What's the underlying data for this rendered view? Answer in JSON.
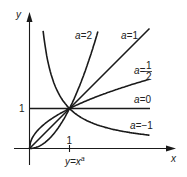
{
  "diagram": {
    "caption_base": "y=x",
    "caption_exp": "a",
    "axes": {
      "x_label": "x",
      "y_label": "y",
      "x_tick_label": "1",
      "y_tick_label": "1"
    },
    "curves": [
      {
        "id": "a2",
        "label_prefix": "a=",
        "label_value": "2",
        "exponent": 2
      },
      {
        "id": "a1",
        "label_prefix": "a=",
        "label_value": "1",
        "exponent": 1
      },
      {
        "id": "ahalf",
        "label_prefix": "a=",
        "label_num": "1",
        "label_den": "2",
        "exponent": 0.5
      },
      {
        "id": "a0",
        "label_prefix": "a=",
        "label_value": "0",
        "exponent": 0
      },
      {
        "id": "aminus1",
        "label_prefix": "a=",
        "label_value": "−1",
        "exponent": -1
      }
    ],
    "intersection_point": "(1,1)",
    "colors": {
      "line": "#1a1a1a",
      "background": "#ffffff"
    }
  }
}
